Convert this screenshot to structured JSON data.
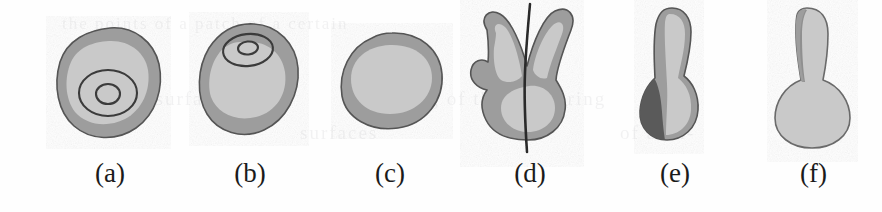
{
  "figure": {
    "background_color": "#fefefe",
    "panel_count": 6,
    "ghost_text": [
      {
        "text": "the points of  a  patch of a certain",
        "x": 62,
        "y": 20,
        "size": 17
      },
      {
        "text": "Subsurface",
        "x": 120,
        "y": 96,
        "size": 19
      },
      {
        "text": "Modeling of the  Scattering",
        "x": 350,
        "y": 96,
        "size": 19
      },
      {
        "text": "surfaces",
        "x": 300,
        "y": 130,
        "size": 19
      },
      {
        "text": "of an  n-",
        "x": 620,
        "y": 130,
        "size": 19
      }
    ]
  },
  "palette": {
    "outline": "#4a4a4a",
    "shade_dark": "#5a5a5a",
    "shade_mid": "#9d9d9d",
    "shade_light": "#c9c9c9",
    "contour_line": "#3a3a3a",
    "axis_line": "#2b2b2b",
    "caption_color": "#1b1b1b"
  },
  "panels": [
    {
      "id": "a",
      "label": "(a)",
      "left": 40,
      "shape_name": "rounded-blob-with-two-contour-rings",
      "description": "Rounded irregular blob, mid-gray outer band, light-gray interior, two concentric dark contour rings below center",
      "has_contour_rings": true,
      "contour_ring_count": 2,
      "has_axis_line": false,
      "has_dark_shadow": false
    },
    {
      "id": "b",
      "label": "(b)",
      "left": 180,
      "shape_name": "tilted-ellipsoid-with-two-contour-rings",
      "description": "Tilted ellipsoidal blob, light interior shifted lower-left, two small concentric contour rings near upper area",
      "has_contour_rings": true,
      "contour_ring_count": 2,
      "has_axis_line": false,
      "has_dark_shadow": false
    },
    {
      "id": "c",
      "label": "(c)",
      "left": 320,
      "shape_name": "tilted-ellipsoid-plain",
      "description": "Tilted ellipsoidal blob, mid-gray rim, large light-gray interior oval, no contours",
      "has_contour_rings": false,
      "contour_ring_count": 0,
      "has_axis_line": false,
      "has_dark_shadow": false
    },
    {
      "id": "d",
      "label": "(d)",
      "left": 455,
      "shape_name": "bilobed-bunny-shape-with-axis",
      "description": "Two-lobed rabbit-ear shape with mid-gray rim and light interior, crossed by a dark vertical curve extending past top and bottom",
      "has_contour_rings": false,
      "contour_ring_count": 0,
      "has_axis_line": true,
      "has_dark_shadow": false
    },
    {
      "id": "e",
      "label": "(e)",
      "left": 610,
      "shape_name": "peanut-shape-with-dark-shadow",
      "description": "Vertical peanut / dumbbell shape, light interior on the right, heavy dark shading over the lower-left bulb",
      "has_contour_rings": false,
      "contour_ring_count": 0,
      "has_axis_line": false,
      "has_dark_shadow": true
    },
    {
      "id": "f",
      "label": "(f)",
      "left": 745,
      "shape_name": "light-bulb-shape",
      "description": "Vertical light-bulb / balloon shape, mostly light gray with a narrow dark band along the left of the neck",
      "has_contour_rings": false,
      "contour_ring_count": 0,
      "has_axis_line": false,
      "has_dark_shadow": false
    }
  ]
}
